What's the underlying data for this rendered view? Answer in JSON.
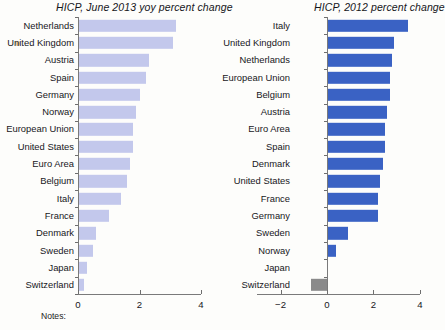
{
  "notes_label": "Notes:",
  "colors": {
    "left_bar": "#c3c8ec",
    "right_bar": "#3a62c4",
    "right_bar_negative": "#8a8a8a",
    "axis": "#7a7a7a",
    "text": "#17171b",
    "background": "#fdfdfb",
    "dot": "#d8b487"
  },
  "chart_data": [
    {
      "type": "bar",
      "orientation": "horizontal",
      "title": "HICP, June 2013 yoy percent change",
      "xlabel": "",
      "ylabel": "",
      "xlim": [
        0,
        4
      ],
      "xticks": [
        0,
        2,
        4
      ],
      "xtick_labels": [
        "0",
        "2",
        "4"
      ],
      "grid": false,
      "legend": "none",
      "categories": [
        "Netherlands",
        "United Kingdom",
        "Austria",
        "Spain",
        "Germany",
        "Norway",
        "European Union",
        "United States",
        "Euro Area",
        "Belgium",
        "Italy",
        "France",
        "Denmark",
        "Sweden",
        "Japan",
        "Switzerland"
      ],
      "values": [
        3.2,
        3.1,
        2.3,
        2.2,
        2.0,
        1.9,
        1.8,
        1.8,
        1.7,
        1.6,
        1.4,
        1.0,
        0.6,
        0.5,
        0.3,
        0.2
      ]
    },
    {
      "type": "bar",
      "orientation": "horizontal",
      "title": "HICP, 2012 percent change",
      "xlabel": "",
      "ylabel": "",
      "xlim": [
        -3,
        4
      ],
      "xticks": [
        -2,
        0,
        2,
        4
      ],
      "xtick_labels": [
        "−2",
        "0",
        "2",
        "4"
      ],
      "grid": false,
      "legend": "none",
      "categories": [
        "Italy",
        "United Kingdom",
        "Netherlands",
        "European Union",
        "Belgium",
        "Austria",
        "Euro Area",
        "Spain",
        "Denmark",
        "United States",
        "France",
        "Germany",
        "Sweden",
        "Norway",
        "Japan",
        "Switzerland"
      ],
      "values": [
        3.5,
        2.9,
        2.8,
        2.7,
        2.7,
        2.6,
        2.5,
        2.5,
        2.4,
        2.3,
        2.2,
        2.2,
        0.9,
        0.4,
        0.0,
        -0.7
      ]
    }
  ]
}
